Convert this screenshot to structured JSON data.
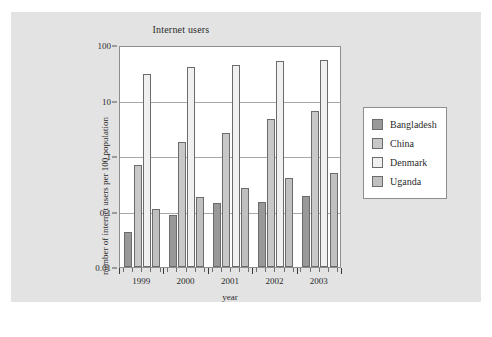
{
  "chart_data": {
    "type": "bar",
    "title": "Internet users",
    "xlabel": "year",
    "ylabel": "number of internet users per 100 population",
    "categories": [
      "1999",
      "2000",
      "2001",
      "2002",
      "2003"
    ],
    "series": [
      {
        "name": "Bangladesh",
        "color": "#999999",
        "values": [
          0.042,
          0.085,
          0.14,
          0.15,
          0.19
        ]
      },
      {
        "name": "China",
        "color": "#c8c8c8",
        "values": [
          0.7,
          1.8,
          2.6,
          4.6,
          6.5
        ]
      },
      {
        "name": "Denmark",
        "color": "#f0f0f0",
        "values": [
          30,
          40,
          43,
          52,
          54
        ]
      },
      {
        "name": "Uganda",
        "color": "#c0c0c0",
        "values": [
          0.11,
          0.18,
          0.26,
          0.4,
          0.5
        ]
      }
    ],
    "yscale": "log",
    "ylim": [
      0.01,
      100
    ],
    "yticks": [
      "0.01",
      "0.1",
      "1",
      "10",
      "100"
    ],
    "ytick_values": [
      0.01,
      0.1,
      1,
      10,
      100
    ],
    "grid": true,
    "legend_position": "right"
  },
  "legend": {
    "items": [
      {
        "label": "Bangladesh"
      },
      {
        "label": "China"
      },
      {
        "label": "Denmark"
      },
      {
        "label": "Uganda"
      }
    ]
  }
}
